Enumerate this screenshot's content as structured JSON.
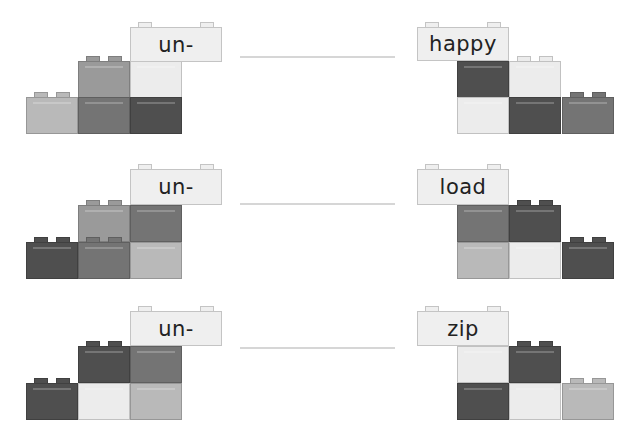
{
  "worksheet": {
    "colors": {
      "very_light": "#ececec",
      "light": "#b9b9b9",
      "mid": "#9a9a9a",
      "mid_dark": "#747474",
      "dark": "#4f4f4f",
      "label": "#efefef",
      "line": "#d6d6d6"
    },
    "rows": [
      {
        "prefix": "un-",
        "word": "happy",
        "left_bricks": [
          "light (bottom-left, studs)",
          "mid (top, studs)",
          "mid_dark (bottom)",
          "very_light (top)",
          "dark (bottom)"
        ],
        "right_bricks": [
          "dark (top)",
          "very_light (bottom)",
          "very_light (top, studs)",
          "dark (bottom)",
          "mid_dark (bottom-right, studs)"
        ]
      },
      {
        "prefix": "un-",
        "word": "load",
        "left_bricks": [
          "dark (bottom-left, studs)",
          "mid (top, studs)",
          "mid_dark (bottom, studs)",
          "mid_dark (top)",
          "light (bottom)"
        ],
        "right_bricks": [
          "mid_dark (top)",
          "light (bottom)",
          "dark (top, studs)",
          "very_light (bottom)",
          "dark (bottom-right, studs)"
        ]
      },
      {
        "prefix": "un-",
        "word": "zip",
        "left_bricks": [
          "dark (bottom-left, studs)",
          "dark (top, studs)",
          "very_light (bottom)",
          "mid_dark (top)",
          "light (bottom)"
        ],
        "right_bricks": [
          "very_light (top)",
          "dark (bottom)",
          "dark (top, studs)",
          "very_light (bottom)",
          "light (bottom-right, studs)"
        ]
      }
    ]
  }
}
